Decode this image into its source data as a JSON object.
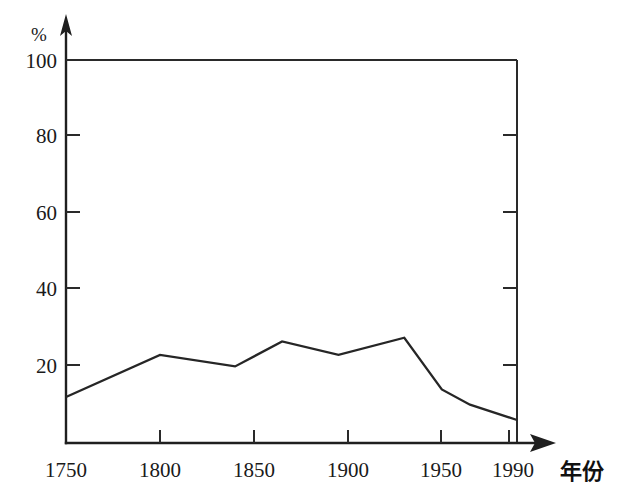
{
  "chart_data": {
    "type": "line",
    "title": "",
    "xlabel": "年份",
    "ylabel": "%",
    "xlim": [
      1750,
      1990
    ],
    "ylim": [
      0,
      100
    ],
    "xticks": [
      1750,
      1800,
      1850,
      1900,
      1950,
      1990
    ],
    "xtick_labels": [
      "1750",
      "1800",
      "1850",
      "1900",
      "1950",
      "1990"
    ],
    "yticks": [
      20,
      40,
      60,
      80,
      100
    ],
    "ytick_labels": [
      "20",
      "40",
      "60",
      "80",
      "100"
    ],
    "grid": false,
    "legend": "none",
    "series": [
      {
        "name": "series-1",
        "x": [
          1750,
          1800,
          1840,
          1865,
          1895,
          1930,
          1950,
          1965,
          1990
        ],
        "values": [
          12,
          23,
          20,
          26.5,
          23,
          27.5,
          14,
          10,
          6
        ]
      }
    ],
    "annotations": []
  },
  "axes": {
    "y_unit": "%",
    "x_title": "年份"
  },
  "icons": {
    "y_axis_arrow": "arrow-up-icon",
    "x_axis_arrow": "arrow-right-icon"
  },
  "colors": {
    "line": "#262626",
    "axis": "#1f1f1f",
    "frame": "#2a2a2a",
    "text": "#1a1a1a",
    "background": "#ffffff"
  }
}
